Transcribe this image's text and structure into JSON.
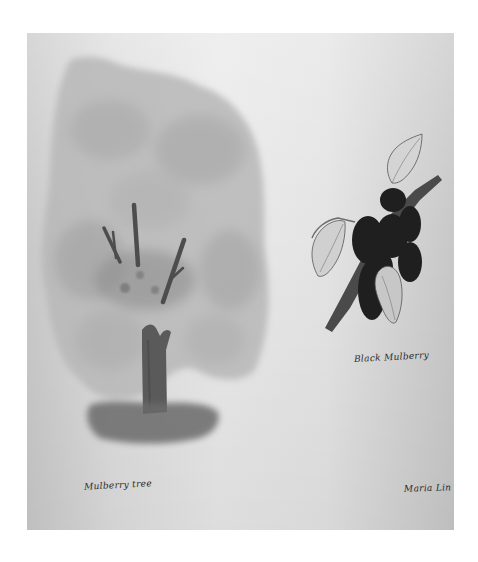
{
  "artwork": {
    "medium": "watercolor illustration",
    "subjects": [
      {
        "name": "mulberry-tree",
        "caption": "Mulberry tree"
      },
      {
        "name": "black-mulberry-branch",
        "caption": "Black Mulberry"
      }
    ],
    "signature": "Maria Lin"
  },
  "colors": {
    "page_background": "#ffffff",
    "paper": "#e4e4e4",
    "canopy": "#a9a9a9",
    "trunk": "#555555",
    "berries": "#1e1e1e",
    "leaves": "#cfcfcf"
  }
}
